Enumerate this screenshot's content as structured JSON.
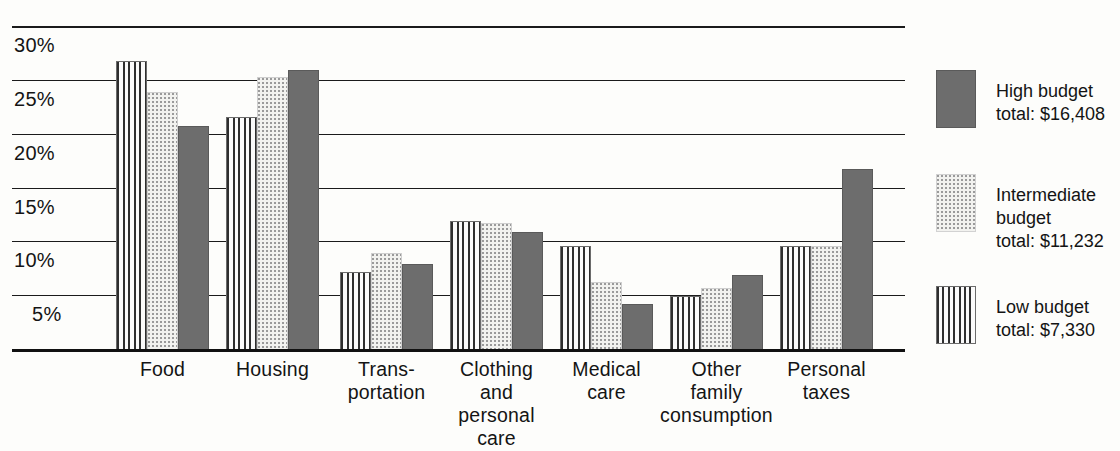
{
  "chart_data": {
    "type": "bar",
    "title": "",
    "xlabel": "",
    "ylabel": "",
    "ylim": [
      0,
      30
    ],
    "grid": true,
    "legend_position": "right",
    "categories": [
      "Food",
      "Housing",
      "Trans-\nportation",
      "Clothing\nand\npersonal\ncare",
      "Medical\ncare",
      "Other\nfamily\nconsumption",
      "Personal\ntaxes"
    ],
    "ytick_labels": [
      "30%",
      "25%",
      "20%",
      "15%",
      "10%",
      "5%"
    ],
    "ytick_values": [
      30,
      25,
      20,
      15,
      10,
      5
    ],
    "series": [
      {
        "name": "Low budget",
        "pattern": "vertical-stripes",
        "values": [
          26.8,
          21.6,
          7.2,
          12.0,
          9.7,
          5.0,
          9.7
        ]
      },
      {
        "name": "Intermediate budget",
        "pattern": "dots",
        "values": [
          24.0,
          25.4,
          9.0,
          11.8,
          6.3,
          5.8,
          9.7
        ]
      },
      {
        "name": "High budget",
        "pattern": "solid-gray",
        "values": [
          20.8,
          26.0,
          8.0,
          11.0,
          4.3,
          7.0,
          16.8
        ]
      }
    ]
  },
  "legend": {
    "entries": [
      {
        "name": "high-budget",
        "swatch": "solid-gray",
        "text": "High budget\ntotal: $16,408"
      },
      {
        "name": "intermediate-budget",
        "swatch": "dots",
        "text": "Intermediate\nbudget\ntotal: $11,232"
      },
      {
        "name": "low-budget",
        "swatch": "vertical-stripes",
        "text": "Low budget\ntotal: $7,330"
      }
    ]
  },
  "colors": {
    "high_budget": "#6d6d6d",
    "intermediate_budget": "#f2f2ef",
    "low_budget": "#f7f7f5",
    "axis": "#111111",
    "background": "#fdfdfb"
  }
}
